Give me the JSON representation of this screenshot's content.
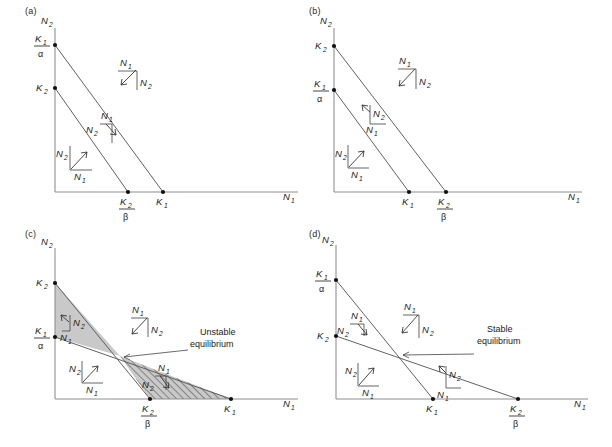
{
  "figure": {
    "panels": [
      {
        "letter": "(a)",
        "axis": {
          "y_label": "N2",
          "x_label": "N1"
        },
        "y_ticks": [
          {
            "name": "K1-over-alpha",
            "num": "K",
            "num_sub": "1",
            "den": "α",
            "fraction": true
          },
          {
            "name": "K2",
            "num": "K",
            "num_sub": "2",
            "fraction": false
          }
        ],
        "x_ticks": [
          {
            "name": "K2-over-beta",
            "num": "K",
            "num_sub": "2",
            "den": "β",
            "fraction": true
          },
          {
            "name": "K1",
            "num": "K",
            "num_sub": "1",
            "fraction": false
          }
        ],
        "vectors": [
          {
            "name": "vector-outside-both",
            "n1": "N1",
            "n2": "N2",
            "direction": "down-left"
          },
          {
            "name": "vector-between-isoclines",
            "n1": "N1",
            "n2": "N2",
            "direction": "down-right"
          },
          {
            "name": "vector-inside-both",
            "n1": "N1",
            "n2": "N2",
            "direction": "up-right"
          }
        ],
        "annotation": null,
        "shading": "none"
      },
      {
        "letter": "(b)",
        "axis": {
          "y_label": "N2",
          "x_label": "N1"
        },
        "y_ticks": [
          {
            "name": "K2",
            "num": "K",
            "num_sub": "2",
            "fraction": false
          },
          {
            "name": "K1-over-alpha",
            "num": "K",
            "num_sub": "1",
            "den": "α",
            "fraction": true
          }
        ],
        "x_ticks": [
          {
            "name": "K1",
            "num": "K",
            "num_sub": "1",
            "fraction": false
          },
          {
            "name": "K2-over-beta",
            "num": "K",
            "num_sub": "2",
            "den": "β",
            "fraction": true
          }
        ],
        "vectors": [
          {
            "name": "vector-outside-both",
            "n1": "N1",
            "n2": "N2",
            "direction": "down-left"
          },
          {
            "name": "vector-between-isoclines",
            "n1": "N1",
            "n2": "N2",
            "direction": "down-left"
          },
          {
            "name": "vector-inside-both",
            "n1": "N1",
            "n2": "N2",
            "direction": "up-right"
          }
        ],
        "annotation": null,
        "shading": "none"
      },
      {
        "letter": "(c)",
        "axis": {
          "y_label": "N2",
          "x_label": "N1"
        },
        "y_ticks": [
          {
            "name": "K2",
            "num": "K",
            "num_sub": "2",
            "fraction": false
          },
          {
            "name": "K1-over-alpha",
            "num": "K",
            "num_sub": "1",
            "den": "α",
            "fraction": true
          }
        ],
        "x_ticks": [
          {
            "name": "K2-over-beta",
            "num": "K",
            "num_sub": "2",
            "den": "β",
            "fraction": true
          },
          {
            "name": "K1",
            "num": "K",
            "num_sub": "1",
            "fraction": false
          }
        ],
        "vectors": [
          {
            "name": "vector-upper-wedge",
            "n1": "N1",
            "n2": "N2",
            "direction": "up-left"
          },
          {
            "name": "vector-outside-both",
            "n1": "N1",
            "n2": "N2",
            "direction": "down-left"
          },
          {
            "name": "vector-inside-both",
            "n1": "N1",
            "n2": "N2",
            "direction": "up-right"
          },
          {
            "name": "vector-lower-wedge",
            "n1": "N1",
            "n2": "N2",
            "direction": "down-right"
          }
        ],
        "annotation": {
          "line1": "Unstable",
          "line2": "equilibrium"
        },
        "shading": "upper-solid-lower-hatched"
      },
      {
        "letter": "(d)",
        "axis": {
          "y_label": "N2",
          "x_label": "N1"
        },
        "y_ticks": [
          {
            "name": "K1-over-alpha",
            "num": "K",
            "num_sub": "1",
            "den": "α",
            "fraction": true
          },
          {
            "name": "K2",
            "num": "K",
            "num_sub": "2",
            "fraction": false
          }
        ],
        "x_ticks": [
          {
            "name": "K1",
            "num": "K",
            "num_sub": "1",
            "fraction": false
          },
          {
            "name": "K2-over-beta",
            "num": "K",
            "num_sub": "2",
            "den": "β",
            "fraction": true
          }
        ],
        "vectors": [
          {
            "name": "vector-upper-wedge",
            "n1": "N1",
            "n2": "N2",
            "direction": "down-right"
          },
          {
            "name": "vector-outside-both",
            "n1": "N1",
            "n2": "N2",
            "direction": "down-left"
          },
          {
            "name": "vector-inside-both",
            "n1": "N1",
            "n2": "N2",
            "direction": "up-right"
          },
          {
            "name": "vector-lower-wedge",
            "n1": "N1",
            "n2": "N2",
            "direction": "down-left"
          }
        ],
        "annotation": {
          "line1": "Stable",
          "line2": "equilibrium"
        },
        "shading": "none"
      }
    ],
    "colors": {
      "axis": "#8d8d8d",
      "isocline": "#5a5a5a",
      "shade_fill": "#c9c9c9",
      "text": "#1a1a1a"
    }
  }
}
